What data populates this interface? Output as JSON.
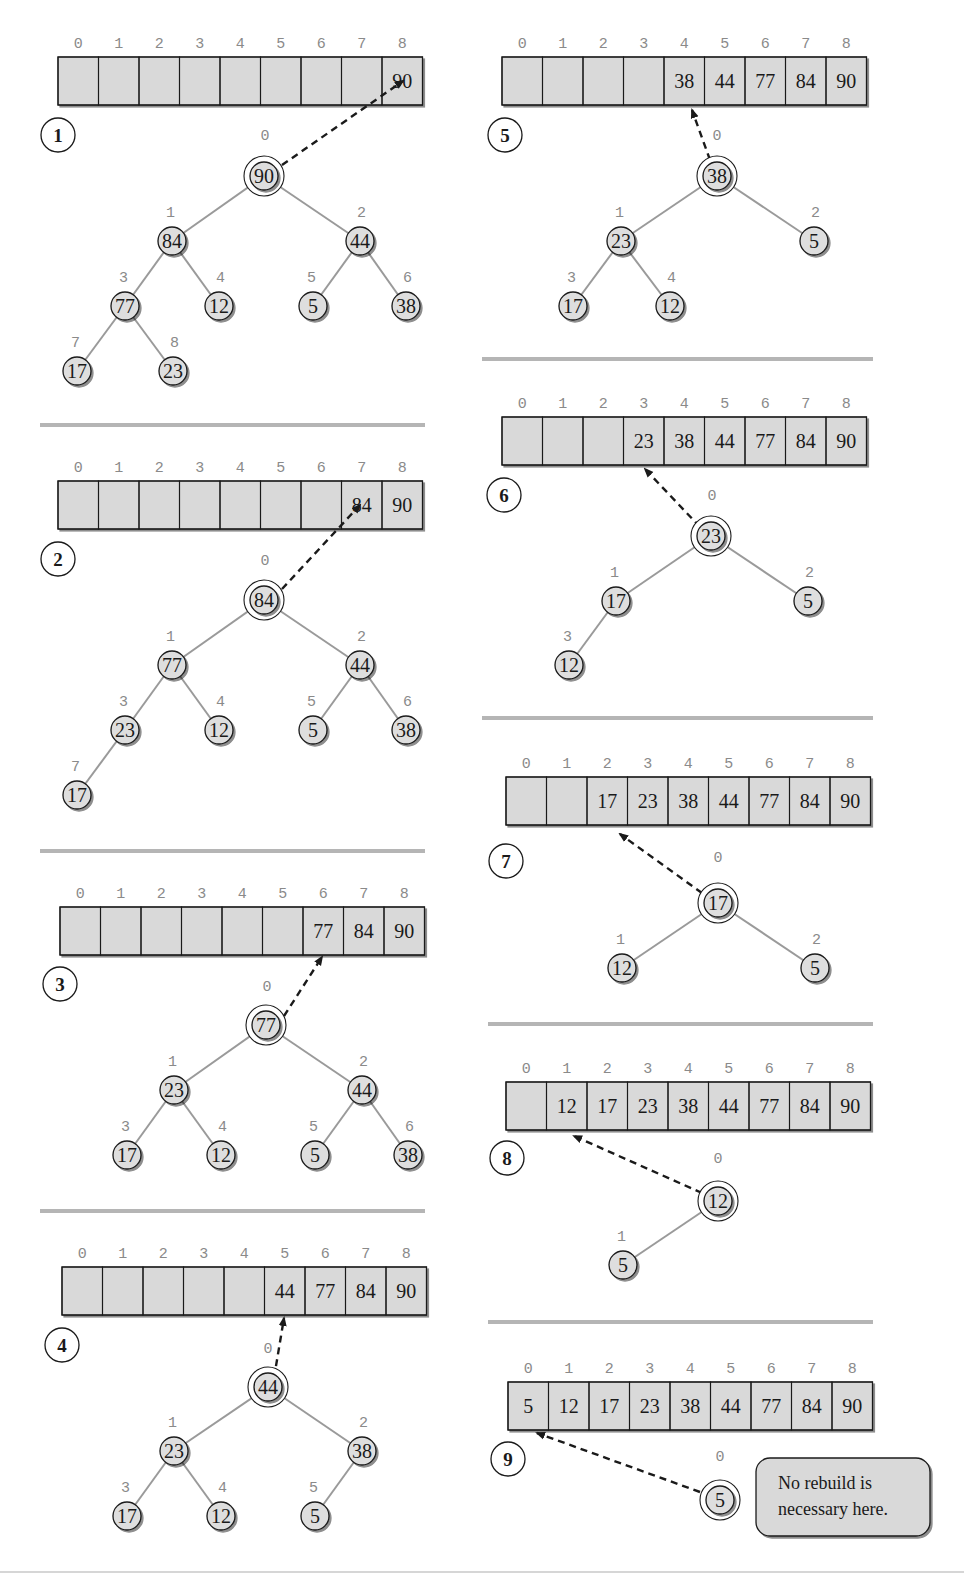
{
  "colors": {
    "cell_fill": "#d9d9d9",
    "node_fill": "#dedede",
    "edge": "#9a9a9a",
    "divider": "#b5b5b5",
    "ink": "#1a1a1a",
    "index_text": "#8a8a8a",
    "note_fill": "#d9d9d9"
  },
  "array_indices": [
    "0",
    "1",
    "2",
    "3",
    "4",
    "5",
    "6",
    "7",
    "8"
  ],
  "panels": [
    {
      "step": "1",
      "array_x": 58,
      "array_y": 57,
      "values": [
        "",
        "",
        "",
        "",
        "",
        "",
        "",
        "",
        "90"
      ],
      "step_pos": [
        58,
        135
      ],
      "root_index_label_pos": [
        265,
        140
      ],
      "arrow": {
        "from": [
          282,
          165
        ],
        "to": [
          403,
          81
        ]
      },
      "nodes": [
        {
          "i": "0",
          "v": "90",
          "x": 264,
          "y": 176,
          "root": true
        },
        {
          "i": "1",
          "v": "84",
          "x": 172,
          "y": 241
        },
        {
          "i": "2",
          "v": "44",
          "x": 360,
          "y": 241
        },
        {
          "i": "3",
          "v": "77",
          "x": 125,
          "y": 306
        },
        {
          "i": "4",
          "v": "12",
          "x": 219,
          "y": 306
        },
        {
          "i": "5",
          "v": "5",
          "x": 313,
          "y": 306
        },
        {
          "i": "6",
          "v": "38",
          "x": 406,
          "y": 306
        },
        {
          "i": "7",
          "v": "17",
          "x": 77,
          "y": 371
        },
        {
          "i": "8",
          "v": "23",
          "x": 173,
          "y": 371
        }
      ],
      "edges": [
        [
          0,
          1
        ],
        [
          0,
          2
        ],
        [
          1,
          3
        ],
        [
          1,
          4
        ],
        [
          2,
          5
        ],
        [
          2,
          6
        ],
        [
          3,
          7
        ],
        [
          3,
          8
        ]
      ]
    },
    {
      "step": "2",
      "array_x": 58,
      "array_y": 481,
      "values": [
        "",
        "",
        "",
        "",
        "",
        "",
        "",
        "84",
        "90"
      ],
      "step_pos": [
        58,
        559
      ],
      "root_index_label_pos": [
        265,
        565
      ],
      "arrow": {
        "from": [
          282,
          589
        ],
        "to": [
          360,
          505
        ]
      },
      "nodes": [
        {
          "i": "0",
          "v": "84",
          "x": 264,
          "y": 600,
          "root": true
        },
        {
          "i": "1",
          "v": "77",
          "x": 172,
          "y": 665
        },
        {
          "i": "2",
          "v": "44",
          "x": 360,
          "y": 665
        },
        {
          "i": "3",
          "v": "23",
          "x": 125,
          "y": 730
        },
        {
          "i": "4",
          "v": "12",
          "x": 219,
          "y": 730
        },
        {
          "i": "5",
          "v": "5",
          "x": 313,
          "y": 730
        },
        {
          "i": "6",
          "v": "38",
          "x": 406,
          "y": 730
        },
        {
          "i": "7",
          "v": "17",
          "x": 77,
          "y": 795
        }
      ],
      "edges": [
        [
          0,
          1
        ],
        [
          0,
          2
        ],
        [
          1,
          3
        ],
        [
          1,
          4
        ],
        [
          2,
          5
        ],
        [
          2,
          6
        ],
        [
          3,
          7
        ]
      ]
    },
    {
      "step": "3",
      "array_x": 60,
      "array_y": 907,
      "values": [
        "",
        "",
        "",
        "",
        "",
        "",
        "77",
        "84",
        "90"
      ],
      "step_pos": [
        60,
        984
      ],
      "root_index_label_pos": [
        267,
        991
      ],
      "arrow": {
        "from": [
          284,
          1016
        ],
        "to": [
          322,
          957
        ]
      },
      "nodes": [
        {
          "i": "0",
          "v": "77",
          "x": 266,
          "y": 1025,
          "root": true
        },
        {
          "i": "1",
          "v": "23",
          "x": 174,
          "y": 1090
        },
        {
          "i": "2",
          "v": "44",
          "x": 362,
          "y": 1090
        },
        {
          "i": "3",
          "v": "17",
          "x": 127,
          "y": 1155
        },
        {
          "i": "4",
          "v": "12",
          "x": 221,
          "y": 1155
        },
        {
          "i": "5",
          "v": "5",
          "x": 315,
          "y": 1155
        },
        {
          "i": "6",
          "v": "38",
          "x": 408,
          "y": 1155
        }
      ],
      "edges": [
        [
          0,
          1
        ],
        [
          0,
          2
        ],
        [
          1,
          3
        ],
        [
          1,
          4
        ],
        [
          2,
          5
        ],
        [
          2,
          6
        ]
      ]
    },
    {
      "step": "4",
      "array_x": 62,
      "array_y": 1267,
      "values": [
        "",
        "",
        "",
        "",
        "",
        "44",
        "77",
        "84",
        "90"
      ],
      "step_pos": [
        62,
        1345
      ],
      "root_index_label_pos": [
        268,
        1353
      ],
      "arrow": {
        "from": [
          274,
          1378
        ],
        "to": [
          284,
          1318
        ]
      },
      "nodes": [
        {
          "i": "0",
          "v": "44",
          "x": 268,
          "y": 1387,
          "root": true
        },
        {
          "i": "1",
          "v": "23",
          "x": 174,
          "y": 1451
        },
        {
          "i": "2",
          "v": "38",
          "x": 362,
          "y": 1451
        },
        {
          "i": "3",
          "v": "17",
          "x": 127,
          "y": 1516
        },
        {
          "i": "4",
          "v": "12",
          "x": 221,
          "y": 1516
        },
        {
          "i": "5",
          "v": "5",
          "x": 315,
          "y": 1516
        }
      ],
      "edges": [
        [
          0,
          1
        ],
        [
          0,
          2
        ],
        [
          1,
          3
        ],
        [
          1,
          4
        ],
        [
          2,
          5
        ]
      ]
    },
    {
      "step": "5",
      "array_x": 502,
      "array_y": 57,
      "values": [
        "",
        "",
        "",
        "",
        "38",
        "44",
        "77",
        "84",
        "90"
      ],
      "step_pos": [
        505,
        135
      ],
      "root_index_label_pos": [
        717,
        140
      ],
      "arrow": {
        "from": [
          710,
          160
        ],
        "to": [
          692,
          110
        ]
      },
      "nodes": [
        {
          "i": "0",
          "v": "38",
          "x": 717,
          "y": 176,
          "root": true
        },
        {
          "i": "1",
          "v": "23",
          "x": 621,
          "y": 241
        },
        {
          "i": "2",
          "v": "5",
          "x": 814,
          "y": 241
        },
        {
          "i": "3",
          "v": "17",
          "x": 573,
          "y": 306
        },
        {
          "i": "4",
          "v": "12",
          "x": 670,
          "y": 306
        }
      ],
      "edges": [
        [
          0,
          1
        ],
        [
          0,
          2
        ],
        [
          1,
          3
        ],
        [
          1,
          4
        ]
      ]
    },
    {
      "step": "6",
      "array_x": 502,
      "array_y": 417,
      "values": [
        "",
        "",
        "",
        "23",
        "38",
        "44",
        "77",
        "84",
        "90"
      ],
      "step_pos": [
        504,
        495
      ],
      "root_index_label_pos": [
        712,
        500
      ],
      "arrow": {
        "from": [
          700,
          527
        ],
        "to": [
          645,
          469
        ]
      },
      "nodes": [
        {
          "i": "0",
          "v": "23",
          "x": 711,
          "y": 536,
          "root": true
        },
        {
          "i": "1",
          "v": "17",
          "x": 616,
          "y": 601
        },
        {
          "i": "2",
          "v": "5",
          "x": 808,
          "y": 601
        },
        {
          "i": "3",
          "v": "12",
          "x": 569,
          "y": 665
        }
      ],
      "edges": [
        [
          0,
          1
        ],
        [
          0,
          2
        ],
        [
          1,
          3
        ]
      ]
    },
    {
      "step": "7",
      "array_x": 506,
      "array_y": 777,
      "values": [
        "",
        "",
        "17",
        "23",
        "38",
        "44",
        "77",
        "84",
        "90"
      ],
      "step_pos": [
        506,
        861
      ],
      "root_index_label_pos": [
        718,
        862
      ],
      "arrow": {
        "from": [
          702,
          893
        ],
        "to": [
          620,
          834
        ]
      },
      "nodes": [
        {
          "i": "0",
          "v": "17",
          "x": 718,
          "y": 903,
          "root": true
        },
        {
          "i": "1",
          "v": "12",
          "x": 622,
          "y": 968
        },
        {
          "i": "2",
          "v": "5",
          "x": 815,
          "y": 968
        }
      ],
      "edges": [
        [
          0,
          1
        ],
        [
          0,
          2
        ]
      ]
    },
    {
      "step": "8",
      "array_x": 506,
      "array_y": 1082,
      "values": [
        "",
        "12",
        "17",
        "23",
        "38",
        "44",
        "77",
        "84",
        "90"
      ],
      "step_pos": [
        507,
        1158
      ],
      "root_index_label_pos": [
        718,
        1163
      ],
      "arrow": {
        "from": [
          702,
          1193
        ],
        "to": [
          574,
          1136
        ]
      },
      "nodes": [
        {
          "i": "0",
          "v": "12",
          "x": 718,
          "y": 1201,
          "root": true
        },
        {
          "i": "1",
          "v": "5",
          "x": 623,
          "y": 1265
        }
      ],
      "edges": [
        [
          0,
          1
        ]
      ]
    },
    {
      "step": "9",
      "array_x": 508,
      "array_y": 1382,
      "values": [
        "5",
        "12",
        "17",
        "23",
        "38",
        "44",
        "77",
        "84",
        "90"
      ],
      "step_pos": [
        508,
        1459
      ],
      "root_index_label_pos": [
        720,
        1461
      ],
      "arrow": {
        "from": [
          700,
          1492
        ],
        "to": [
          537,
          1433
        ]
      },
      "nodes": [
        {
          "i": "0",
          "v": "5",
          "x": 720,
          "y": 1500,
          "root": true
        }
      ],
      "edges": [],
      "note": {
        "line1": "No rebuild is",
        "line2": "necessary here.",
        "x": 756,
        "y": 1458,
        "w": 174,
        "h": 78
      }
    }
  ],
  "dividers": [
    {
      "x1": 40,
      "x2": 425,
      "y": 425
    },
    {
      "x1": 40,
      "x2": 425,
      "y": 851
    },
    {
      "x1": 40,
      "x2": 425,
      "y": 1211
    },
    {
      "x1": 482,
      "x2": 873,
      "y": 359
    },
    {
      "x1": 482,
      "x2": 873,
      "y": 718
    },
    {
      "x1": 488,
      "x2": 873,
      "y": 1024
    },
    {
      "x1": 488,
      "x2": 873,
      "y": 1322
    }
  ],
  "bottom_rule": {
    "x1": 0,
    "x2": 964,
    "y": 1572
  }
}
